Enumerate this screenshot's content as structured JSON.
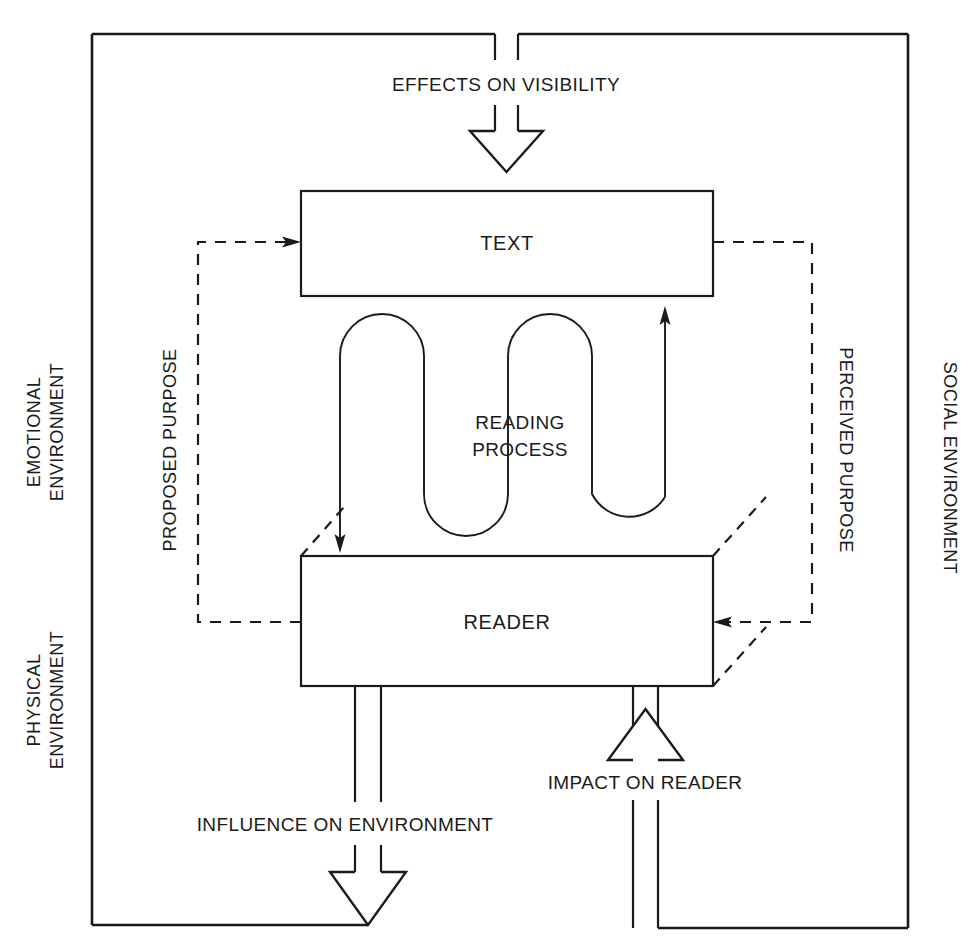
{
  "diagram": {
    "colors": {
      "ink": "#1a1a1a",
      "background": "#ffffff"
    },
    "boxes": {
      "text_box": "TEXT",
      "reader_box": "READER",
      "process_line1": "READING",
      "process_line2": "PROCESS"
    },
    "flow_labels": {
      "effects_on_visibility": "EFFECTS ON VISIBILITY",
      "influence_on_environment": "INFLUENCE ON ENVIRONMENT",
      "impact_on_reader": "IMPACT ON READER"
    },
    "purpose_labels": {
      "proposed_purpose": "PROPOSED PURPOSE",
      "perceived_purpose": "PERCEIVED PURPOSE"
    },
    "environment_labels": {
      "emotional_line1": "EMOTIONAL",
      "emotional_line2": "ENVIRONMENT",
      "physical_line1": "PHYSICAL",
      "physical_line2": "ENVIRONMENT",
      "social": "SOCIAL ENVIRONMENT"
    }
  }
}
